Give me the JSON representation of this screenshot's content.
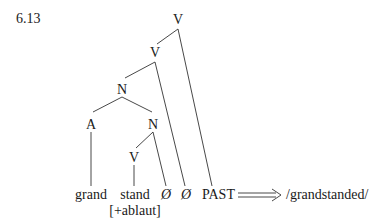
{
  "example_number": "6.13",
  "nodes": {
    "v_top": "V",
    "v_mid": "V",
    "n_top": "N",
    "a": "A",
    "n_low": "N",
    "v_low": "V"
  },
  "terminals": {
    "grand": "grand",
    "stand": "stand",
    "stand_feature": "[+ablaut]",
    "null1": "Ø",
    "null2": "Ø",
    "past": "PAST"
  },
  "arrow": "⟹",
  "output_form": "/grandstanded/"
}
